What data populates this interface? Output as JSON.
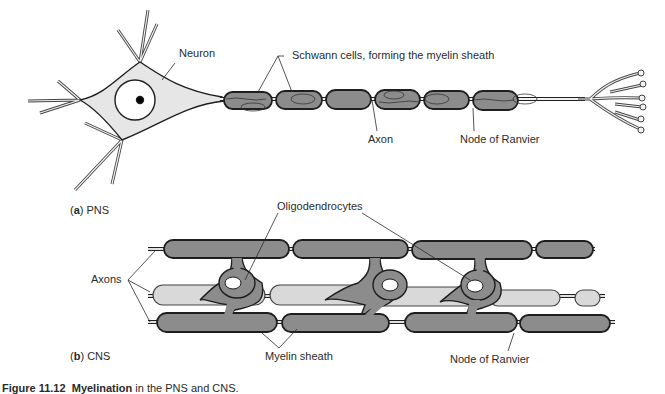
{
  "figure": {
    "panel_a": {
      "letter": "a",
      "label": "PNS"
    },
    "panel_b": {
      "letter": "b",
      "label": "CNS"
    },
    "caption": {
      "figure_number": "Figure 11.12",
      "title": "Myelination",
      "rest": "in the PNS and CNS."
    }
  },
  "labels": {
    "neuron": "Neuron",
    "schwann_cells": "Schwann cells, forming the myelin sheath",
    "axon": "Axon",
    "node_of_ranvier_a": "Node of Ranvier",
    "oligodendrocytes": "Oligodendrocytes",
    "axons": "Axons",
    "myelin_sheath": "Myelin sheath",
    "node_of_ranvier_b": "Node of Ranvier"
  },
  "colors": {
    "myelin_dark": "#8c8c8c",
    "myelin_light": "#d9d9d9",
    "cell_body": "#e6e6e6",
    "outline": "#1e1e1e"
  }
}
